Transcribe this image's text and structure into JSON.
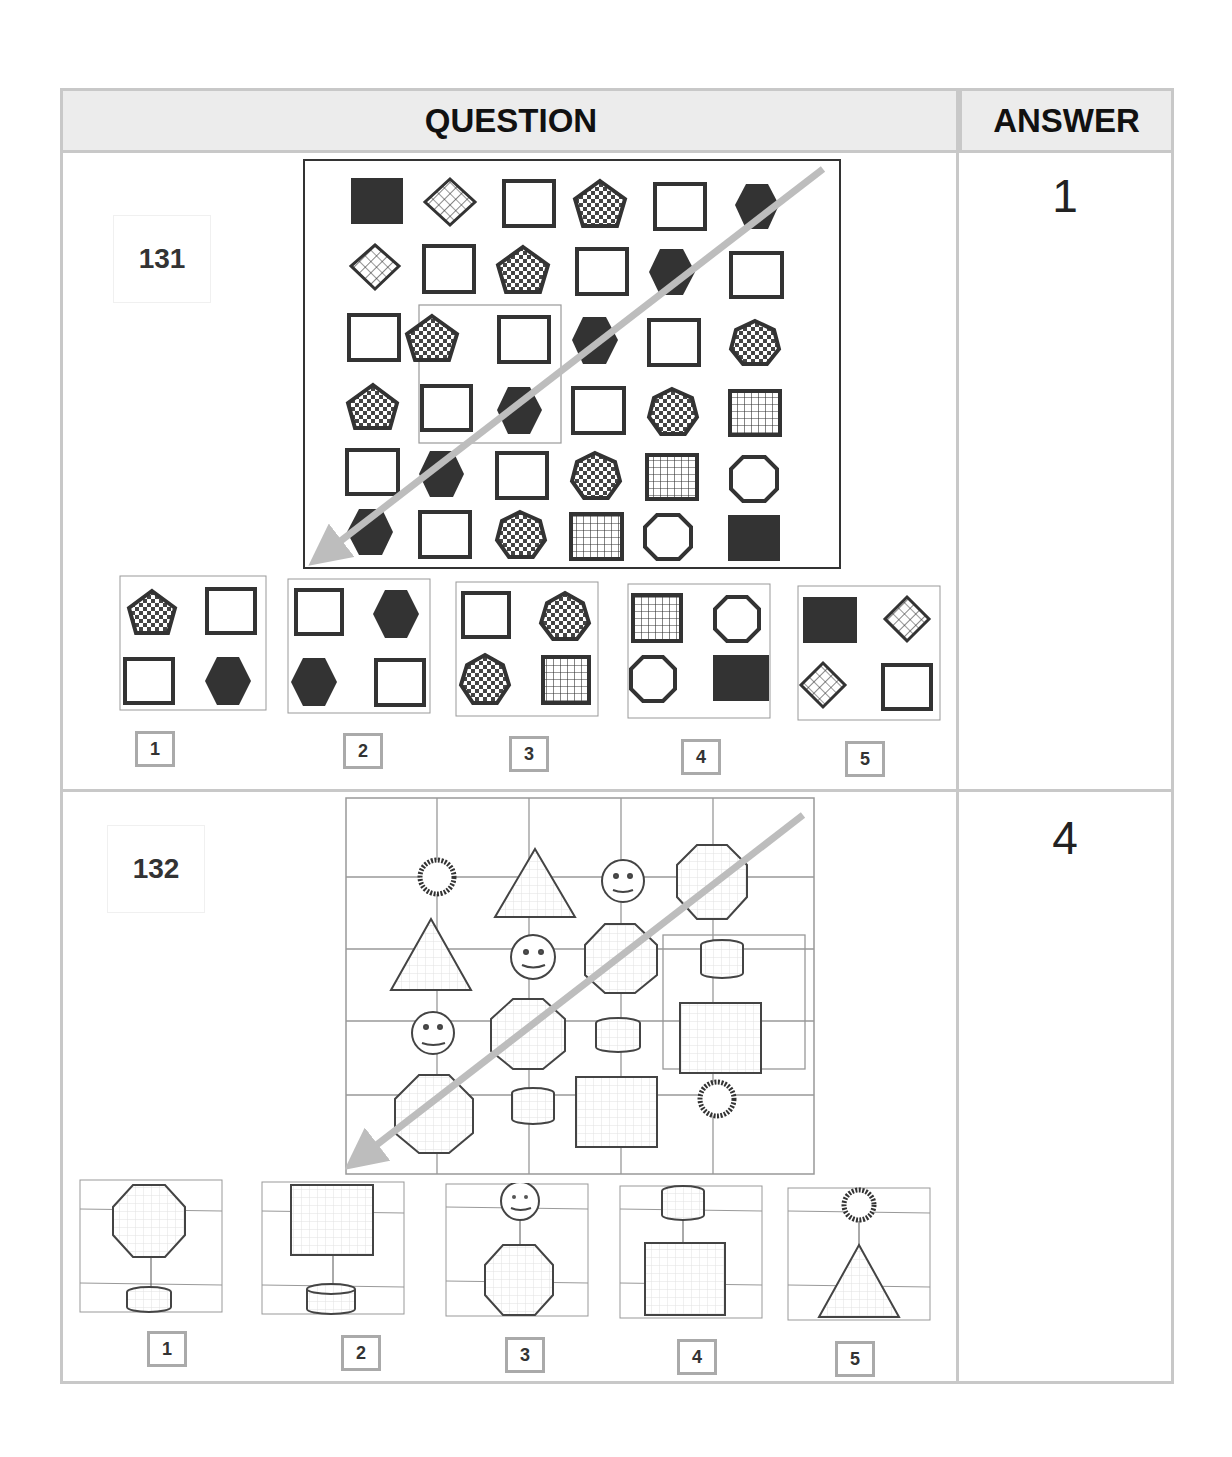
{
  "header": {
    "question_label": "QUESTION",
    "answer_label": "ANSWER"
  },
  "questions": [
    {
      "number": "131",
      "answer": "1",
      "grid": {
        "rows": 6,
        "cols": 6,
        "cells": [
          [
            "filled-square",
            "hatched-diamond",
            "empty-square",
            "checkered-pentagon",
            "empty-square",
            "filled-hexagon"
          ],
          [
            "hatched-diamond",
            "empty-square",
            "checkered-pentagon",
            "empty-square",
            "filled-hexagon",
            "empty-square"
          ],
          [
            "empty-square",
            "checkered-pentagon",
            "empty-square",
            "filled-hexagon",
            "empty-square",
            "checkered-heptagon"
          ],
          [
            "checkered-pentagon",
            "empty-square",
            "filled-hexagon",
            "empty-square",
            "checkered-heptagon",
            "grid-square"
          ],
          [
            "empty-square",
            "filled-hexagon",
            "empty-square",
            "checkered-heptagon",
            "grid-square",
            "empty-octagon"
          ],
          [
            "filled-hexagon",
            "empty-square",
            "checkered-heptagon",
            "grid-square",
            "empty-octagon",
            "filled-square"
          ]
        ],
        "highlight": "rows 3-4, cols 2-3",
        "arrow": "diagonal top-right to bottom-left"
      },
      "options": [
        {
          "label": "1",
          "shapes": [
            "checkered-pentagon",
            "empty-square",
            "empty-square",
            "filled-hexagon"
          ]
        },
        {
          "label": "2",
          "shapes": [
            "empty-square",
            "filled-hexagon",
            "filled-hexagon",
            "empty-square"
          ]
        },
        {
          "label": "3",
          "shapes": [
            "empty-square",
            "checkered-heptagon",
            "checkered-heptagon",
            "grid-square"
          ]
        },
        {
          "label": "4",
          "shapes": [
            "grid-square",
            "empty-octagon",
            "empty-octagon",
            "filled-square"
          ]
        },
        {
          "label": "5",
          "shapes": [
            "filled-square",
            "hatched-diamond",
            "hatched-diamond",
            "empty-square"
          ]
        }
      ]
    },
    {
      "number": "132",
      "answer": "4",
      "grid": {
        "rows": 4,
        "cols": 4,
        "cells": [
          [
            "sun",
            "triangle",
            "smiley",
            "octagon"
          ],
          [
            "triangle",
            "smiley",
            "octagon",
            "cylinder"
          ],
          [
            "smiley",
            "octagon",
            "cylinder",
            "square"
          ],
          [
            "octagon",
            "cylinder",
            "square",
            "sun"
          ]
        ],
        "highlight": "rows 2-3, col 4",
        "arrow": "diagonal top-right to bottom-left"
      },
      "options": [
        {
          "label": "1",
          "shapes": [
            "octagon",
            "cylinder"
          ]
        },
        {
          "label": "2",
          "shapes": [
            "square",
            "cylinder"
          ]
        },
        {
          "label": "3",
          "shapes": [
            "smiley",
            "octagon"
          ]
        },
        {
          "label": "4",
          "shapes": [
            "cylinder",
            "square"
          ]
        },
        {
          "label": "5",
          "shapes": [
            "sun",
            "triangle"
          ]
        }
      ]
    }
  ],
  "colors": {
    "border": "#c8c8c8",
    "header_bg": "#ececec",
    "shape_dark": "#333333",
    "arrow": "#bdbdbd"
  }
}
